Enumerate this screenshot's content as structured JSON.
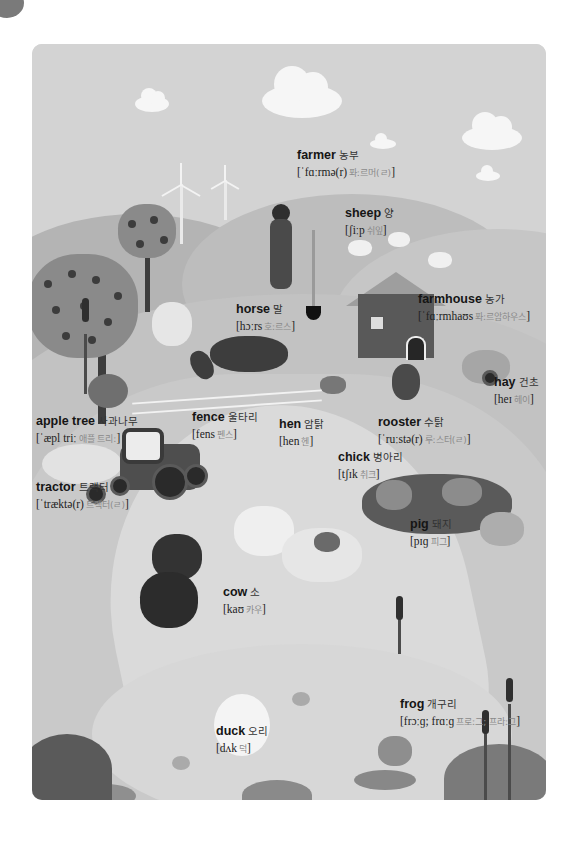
{
  "page": {
    "palette": {
      "background": "#ffffff",
      "panel": "#cfcfcf",
      "text": "#151515",
      "korean_pronunciation": "#8a8a8a"
    }
  },
  "labels": [
    {
      "id": "farmer",
      "word": "farmer",
      "korean": "농부",
      "ipa": "[ˈfɑːrmə(r)",
      "ipa_korean": "퐈ː르머(ㄹ)",
      "close": "]",
      "x": 297,
      "y": 146
    },
    {
      "id": "sheep",
      "word": "sheep",
      "korean": "양",
      "ipa": "[ʃiːp",
      "ipa_korean": "쉬잎",
      "close": "]",
      "x": 345,
      "y": 204
    },
    {
      "id": "horse",
      "word": "horse",
      "korean": "말",
      "ipa": "[hɔːrs",
      "ipa_korean": "호ː르스",
      "close": "]",
      "x": 236,
      "y": 300
    },
    {
      "id": "farmhouse",
      "word": "farmhouse",
      "korean": "농가",
      "ipa": "[ˈfɑːrmhaʊs",
      "ipa_korean": "퐈ː르암하우스",
      "close": "]",
      "x": 418,
      "y": 290
    },
    {
      "id": "hay",
      "word": "hay",
      "korean": "건초",
      "ipa": "[heɪ",
      "ipa_korean": "헤이",
      "close": "]",
      "x": 494,
      "y": 373
    },
    {
      "id": "apple-tree",
      "word": "apple tree",
      "korean": "사과나무",
      "ipa": "[ˈæpl triː",
      "ipa_korean": "애플 트리ː",
      "close": "]",
      "x": 36,
      "y": 412
    },
    {
      "id": "fence",
      "word": "fence",
      "korean": "울타리",
      "ipa": "[fens",
      "ipa_korean": "펜스",
      "close": "]",
      "x": 192,
      "y": 408
    },
    {
      "id": "hen",
      "word": "hen",
      "korean": "암탉",
      "ipa": "[hen",
      "ipa_korean": "헨",
      "close": "]",
      "x": 279,
      "y": 415
    },
    {
      "id": "rooster",
      "word": "rooster",
      "korean": "수탉",
      "ipa": "[ˈruːstə(r)",
      "ipa_korean": "루ː스터(ㄹ)",
      "close": "]",
      "x": 378,
      "y": 413
    },
    {
      "id": "chick",
      "word": "chick",
      "korean": "병아리",
      "ipa": "[tʃɪk",
      "ipa_korean": "취크",
      "close": "]",
      "x": 338,
      "y": 448
    },
    {
      "id": "tractor",
      "word": "tractor",
      "korean": "트랙터",
      "ipa": "[ˈtræktə(r)",
      "ipa_korean": "트랙터(ㄹ)",
      "close": "]",
      "x": 36,
      "y": 478
    },
    {
      "id": "pig",
      "word": "pig",
      "korean": "돼지",
      "ipa": "[pɪɡ",
      "ipa_korean": "피그",
      "close": "]",
      "x": 410,
      "y": 515
    },
    {
      "id": "cow",
      "word": "cow",
      "korean": "소",
      "ipa": "[kaʊ",
      "ipa_korean": "카우",
      "close": "]",
      "x": 223,
      "y": 583
    },
    {
      "id": "frog",
      "word": "frog",
      "korean": "개구리",
      "ipa": "[frɔːɡ; frɑːɡ",
      "ipa_korean": "프로ː그; 프라ː그",
      "close": "]",
      "x": 400,
      "y": 695
    },
    {
      "id": "duck",
      "word": "duck",
      "korean": "오리",
      "ipa": "[dʌk",
      "ipa_korean": "덕",
      "close": "]",
      "x": 216,
      "y": 722
    }
  ]
}
